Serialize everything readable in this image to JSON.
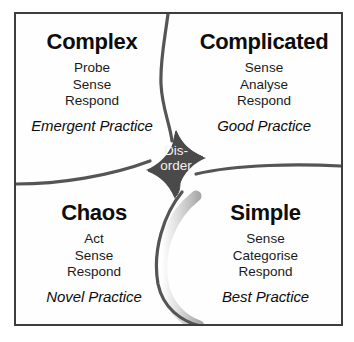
{
  "diagram": {
    "name": "Cynefin framework",
    "center": {
      "label": "Disorder",
      "line1": "Dis-",
      "line2": "order",
      "fill_color": "#4a4a4a",
      "text_color": "#f2f2f2"
    },
    "frame_color": "#3d3d3d",
    "background_color": "#ffffff",
    "divider_color": "#555555",
    "quadrants": [
      {
        "id": "complex",
        "title": "Complex",
        "steps": [
          "Probe",
          "Sense",
          "Respond"
        ],
        "practice": "Emergent Practice",
        "position": "top-left"
      },
      {
        "id": "complicated",
        "title": "Complicated",
        "steps": [
          "Sense",
          "Analyse",
          "Respond"
        ],
        "practice": "Good Practice",
        "position": "top-right"
      },
      {
        "id": "chaos",
        "title": "Chaos",
        "steps": [
          "Act",
          "Sense",
          "Respond"
        ],
        "practice": "Novel Practice",
        "position": "bottom-left"
      },
      {
        "id": "simple",
        "title": "Simple",
        "steps": [
          "Sense",
          "Categorise",
          "Respond"
        ],
        "practice": "Best Practice",
        "position": "bottom-right"
      }
    ]
  }
}
